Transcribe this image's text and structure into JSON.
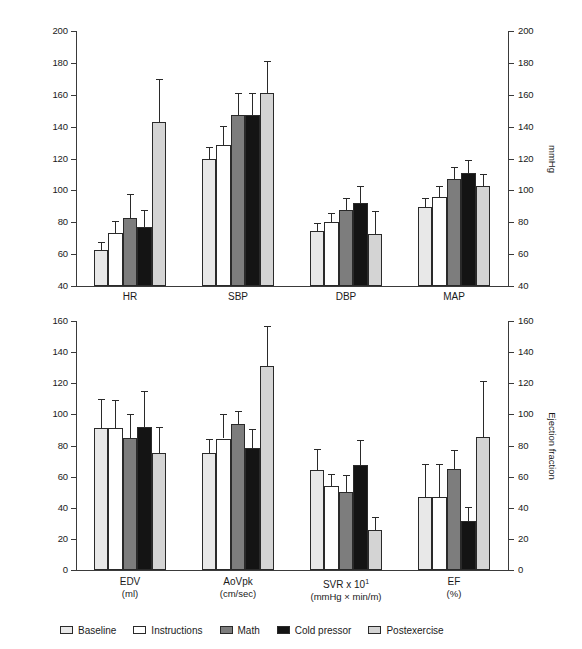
{
  "figure": {
    "title": "",
    "background": "#ffffff",
    "series_colors": [
      "#e8e8e8",
      "#ffffff",
      "#7d7d7d",
      "#141414",
      "#d4d4d4"
    ]
  },
  "legend": {
    "position": "bottom",
    "items": [
      {
        "label": "Baseline",
        "color": "#e8e8e8"
      },
      {
        "label": "Instructions",
        "color": "#ffffff"
      },
      {
        "label": "Math",
        "color": "#7d7d7d"
      },
      {
        "label": "Cold pressor",
        "color": "#141414"
      },
      {
        "label": "Postexercise",
        "color": "#d4d4d4"
      }
    ]
  },
  "chart_data": [
    {
      "id": "panel-top",
      "type": "bar",
      "title": "",
      "xlabel": "",
      "ylabel": "bpm",
      "ylabel_right": "mmHg",
      "ylim": [
        40,
        200
      ],
      "ylim_right": [
        40,
        200
      ],
      "yticks": [
        40,
        60,
        80,
        100,
        120,
        140,
        160,
        180,
        200
      ],
      "yticks_right": [
        40,
        60,
        80,
        100,
        120,
        140,
        160,
        180,
        200
      ],
      "grid": false,
      "errorbars": true,
      "categories": [
        "HR",
        "SBP",
        "DBP",
        "MAP"
      ],
      "category_units": [
        "",
        "",
        "",
        ""
      ],
      "series": [
        {
          "name": "Baseline",
          "values": [
            62.5,
            119.5,
            74.5,
            89.5
          ],
          "errors": [
            5.0,
            7.5,
            5.0,
            5.5
          ]
        },
        {
          "name": "Instructions",
          "values": [
            73.0,
            128.5,
            80.0,
            96.0
          ],
          "errors": [
            8.0,
            12.0,
            6.0,
            7.0
          ]
        },
        {
          "name": "Math",
          "values": [
            82.5,
            147.5,
            87.5,
            107.0
          ],
          "errors": [
            15.0,
            13.5,
            7.5,
            8.0
          ]
        },
        {
          "name": "Cold pressor",
          "values": [
            77.0,
            147.5,
            92.0,
            111.0
          ],
          "errors": [
            10.5,
            13.5,
            10.5,
            8.0
          ]
        },
        {
          "name": "Postexercise",
          "values": [
            143.0,
            161.0,
            72.5,
            102.5
          ],
          "errors": [
            27.0,
            20.0,
            14.5,
            8.0
          ]
        }
      ]
    },
    {
      "id": "panel-bottom",
      "type": "bar",
      "title": "",
      "xlabel": "",
      "ylabel": "EDV, AoVpk, SVR",
      "ylabel_right": "Ejection fraction",
      "ylim": [
        0,
        160
      ],
      "ylim_right": [
        0,
        160
      ],
      "yticks": [
        0,
        20,
        40,
        60,
        80,
        100,
        120,
        140,
        160
      ],
      "yticks_right": [
        0,
        20,
        40,
        60,
        80,
        100,
        120,
        140,
        160
      ],
      "grid": false,
      "errorbars": true,
      "categories": [
        "EDV",
        "AoVpk",
        "SVR x 10",
        "EF"
      ],
      "category_superscripts": [
        "",
        "",
        "1",
        ""
      ],
      "category_units": [
        "(ml)",
        "(cm/sec)",
        "(mmHg × min/m)",
        "(%)"
      ],
      "series": [
        {
          "name": "Baseline",
          "values": [
            91.0,
            75.0,
            64.5,
            47.0
          ],
          "errors": [
            19.0,
            9.0,
            13.0,
            21.0
          ]
        },
        {
          "name": "Instructions",
          "values": [
            91.0,
            84.5,
            54.0,
            47.0
          ],
          "errors": [
            18.0,
            16.0,
            8.0,
            21.0
          ]
        },
        {
          "name": "Math",
          "values": [
            85.0,
            94.0,
            50.0,
            65.0
          ],
          "errors": [
            15.0,
            8.0,
            11.0,
            12.0
          ]
        },
        {
          "name": "Cold pressor",
          "values": [
            92.0,
            78.5,
            67.5,
            31.5
          ],
          "errors": [
            23.0,
            12.0,
            16.0,
            9.0
          ]
        },
        {
          "name": "Postexercise",
          "values": [
            75.0,
            131.0,
            26.0,
            85.5
          ],
          "errors": [
            17.0,
            26.0,
            8.0,
            36.0
          ]
        }
      ]
    }
  ]
}
